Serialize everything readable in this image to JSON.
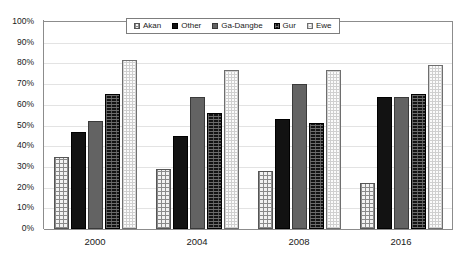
{
  "chart_data": {
    "type": "bar",
    "title": "",
    "subtitle": "",
    "xlabel": "",
    "ylabel": "",
    "categories": [
      "2000",
      "2004",
      "2008",
      "2016"
    ],
    "ylim": [
      0,
      100
    ],
    "y_tick_labels": [
      "100%",
      "90%",
      "80%",
      "70%",
      "60%",
      "50%",
      "40%",
      "30%",
      "20%",
      "10%",
      "0%"
    ],
    "y_tick_values": [
      100,
      90,
      80,
      70,
      60,
      50,
      40,
      30,
      20,
      10,
      0
    ],
    "grid": true,
    "grid_axis": "y",
    "legend_position": "top-center-inside",
    "series": [
      {
        "name": "Akan",
        "pattern": "light-checkered",
        "color": "#f2f2f2",
        "values": [
          35,
          29,
          28,
          22
        ]
      },
      {
        "name": "Other",
        "pattern": "solid-black",
        "color": "#121212",
        "values": [
          47,
          45,
          53,
          64
        ]
      },
      {
        "name": "Ga-Dangbe",
        "pattern": "solid-gray",
        "color": "#636363",
        "values": [
          52,
          64,
          70,
          64
        ]
      },
      {
        "name": "Gur",
        "pattern": "dark-dotted",
        "color": "#141414",
        "values": [
          65,
          56,
          51,
          65
        ]
      },
      {
        "name": "Ewe",
        "pattern": "very-light-checkered",
        "color": "#fbfbfb",
        "values": [
          81.5,
          77,
          77,
          79
        ]
      }
    ]
  },
  "legend": {
    "entries": [
      {
        "label": "Akan"
      },
      {
        "label": "Other"
      },
      {
        "label": "Ga-Dangbe"
      },
      {
        "label": "Gur"
      },
      {
        "label": "Ewe"
      }
    ]
  },
  "colors": {
    "axis": "#8c8c8c",
    "gridline": "#e3e3e3",
    "text": "#1a1a1a",
    "background": "#ffffff"
  }
}
